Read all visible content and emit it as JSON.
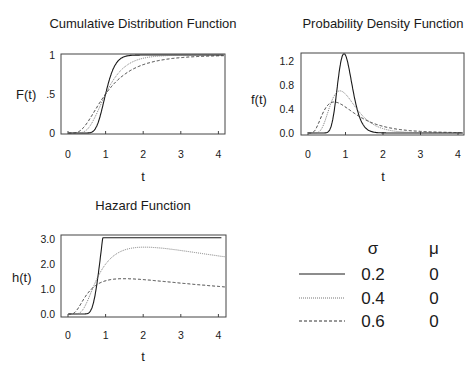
{
  "chart_data": [
    {
      "type": "line",
      "title": "Cumulative Distribution Function",
      "xlabel": "t",
      "ylabel": "F(t)",
      "xlim": [
        0,
        4.2
      ],
      "ylim": [
        0,
        1
      ],
      "xticks": [
        "0",
        "1",
        "2",
        "3",
        "4"
      ],
      "yticks": [
        "0",
        ".5",
        "1"
      ],
      "function": "lognormal_cdf",
      "series": [
        {
          "name": "sigma=0.2",
          "sigma": 0.2,
          "mu": 0,
          "style": "solid",
          "samples": [
            [
              0.5,
              0.0003
            ],
            [
              0.8,
              0.132
            ],
            [
              1,
              0.5
            ],
            [
              1.2,
              0.819
            ],
            [
              1.5,
              0.979
            ],
            [
              2,
              1.0
            ],
            [
              4,
              1.0
            ]
          ]
        },
        {
          "name": "sigma=0.4",
          "sigma": 0.4,
          "mu": 0,
          "style": "dotted",
          "samples": [
            [
              0.5,
              0.042
            ],
            [
              0.8,
              0.288
            ],
            [
              1,
              0.5
            ],
            [
              1.5,
              0.844
            ],
            [
              2,
              0.958
            ],
            [
              3,
              0.997
            ],
            [
              4,
              1.0
            ]
          ]
        },
        {
          "name": "sigma=0.6",
          "sigma": 0.6,
          "mu": 0,
          "style": "dashed",
          "samples": [
            [
              0.5,
              0.124
            ],
            [
              0.8,
              0.356
            ],
            [
              1,
              0.5
            ],
            [
              1.5,
              0.75
            ],
            [
              2,
              0.876
            ],
            [
              3,
              0.966
            ],
            [
              4,
              0.989
            ]
          ]
        }
      ]
    },
    {
      "type": "line",
      "title": "Probability Density Function",
      "xlabel": "t",
      "ylabel": "f(t)",
      "xlim": [
        0,
        4.2
      ],
      "ylim": [
        0,
        1.3
      ],
      "xticks": [
        "0",
        "1",
        "2",
        "3",
        "4"
      ],
      "yticks": [
        "0.0",
        "0.4",
        "0.8",
        "1.2"
      ],
      "function": "lognormal_pdf",
      "series": [
        {
          "name": "sigma=0.2",
          "sigma": 0.2,
          "mu": 0,
          "style": "solid",
          "peak": [
            0.96,
            2.0
          ]
        },
        {
          "name": "sigma=0.4",
          "sigma": 0.4,
          "mu": 0,
          "style": "dotted",
          "peak": [
            0.85,
            1.06
          ]
        },
        {
          "name": "sigma=0.6",
          "sigma": 0.6,
          "mu": 0,
          "style": "dashed",
          "peak": [
            0.7,
            0.8
          ]
        }
      ]
    },
    {
      "type": "line",
      "title": "Hazard Function",
      "xlabel": "t",
      "ylabel": "h(t)",
      "xlim": [
        0,
        4.2
      ],
      "ylim": [
        0,
        3.1
      ],
      "xticks": [
        "0",
        "1",
        "2",
        "3",
        "4"
      ],
      "yticks": [
        "0.0",
        "1.0",
        "2.0",
        "3.0"
      ],
      "function": "lognormal_hazard",
      "series": [
        {
          "name": "sigma=0.2",
          "sigma": 0.2,
          "mu": 0,
          "style": "solid",
          "peak": [
            1.3,
            3.0
          ],
          "end": [
            4.2,
            1.2
          ]
        },
        {
          "name": "sigma=0.4",
          "sigma": 0.4,
          "mu": 0,
          "style": "dotted",
          "peak": [
            1.15,
            1.3
          ],
          "end": [
            4.2,
            0.6
          ]
        },
        {
          "name": "sigma=0.6",
          "sigma": 0.6,
          "mu": 0,
          "style": "dashed",
          "peak": [
            0.9,
            0.85
          ],
          "end": [
            4.2,
            0.4
          ]
        }
      ]
    }
  ],
  "legend": {
    "header_sigma": "σ",
    "header_mu": "μ",
    "rows": [
      {
        "style": "solid",
        "sigma": "0.2",
        "mu": "0"
      },
      {
        "style": "dotted",
        "sigma": "0.4",
        "mu": "0"
      },
      {
        "style": "dashed",
        "sigma": "0.6",
        "mu": "0"
      }
    ]
  },
  "panels": {
    "cdf": {
      "title": "Cumulative Distribution Function",
      "ylabel": "F(t)",
      "xlabel": "t",
      "xticks": [
        "0",
        "1",
        "2",
        "3",
        "4"
      ],
      "yticks": [
        "0",
        ".5",
        "1"
      ]
    },
    "pdf": {
      "title": "Probability Density Function",
      "ylabel": "f(t)",
      "xlabel": "t",
      "xticks": [
        "0",
        "1",
        "2",
        "3",
        "4"
      ],
      "yticks": [
        "0.0",
        "0.4",
        "0.8",
        "1.2"
      ]
    },
    "hazard": {
      "title": "Hazard Function",
      "ylabel": "h(t)",
      "xlabel": "t",
      "xticks": [
        "0",
        "1",
        "2",
        "3",
        "4"
      ],
      "yticks": [
        "0.0",
        "1.0",
        "2.0",
        "3.0"
      ]
    }
  },
  "colors": {
    "line": "#1a1a1a",
    "dotted": "#777777",
    "frame": "#444444"
  }
}
